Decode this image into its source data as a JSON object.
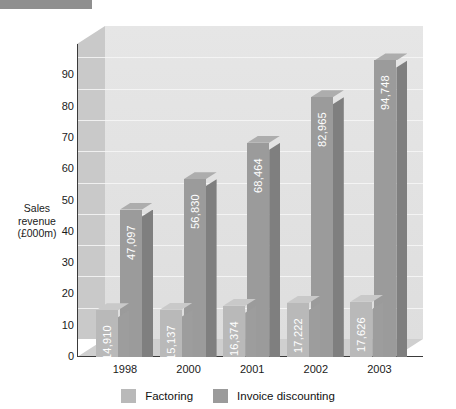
{
  "chart_data": {
    "type": "bar",
    "title": "",
    "subtitle": "",
    "xlabel": "",
    "ylabel": "Sales revenue (£000m)",
    "ylabel_lines": [
      "Sales",
      "revenue",
      "(£000m)"
    ],
    "categories": [
      "1998",
      "2000",
      "2001",
      "2002",
      "2003"
    ],
    "series": [
      {
        "name": "Factoring",
        "color": "#b9b9b9",
        "values": [
          14910,
          15137,
          16374,
          17222,
          17626
        ],
        "labels": [
          "14,910",
          "15,137",
          "16,374",
          "17,222",
          "17,626"
        ],
        "plot_values": [
          14.91,
          15.137,
          16.374,
          17.222,
          17.626
        ]
      },
      {
        "name": "Invoice discounting",
        "color": "#9b9b9b",
        "values": [
          47097,
          56830,
          68464,
          82965,
          94748
        ],
        "labels": [
          "47,097",
          "56,830",
          "68,464",
          "82,965",
          "94,748"
        ],
        "plot_values": [
          47.097,
          56.83,
          68.464,
          82.965,
          94.748
        ]
      }
    ],
    "ylim": [
      0,
      100
    ],
    "ytick_step": 10,
    "yticks": [
      0,
      10,
      20,
      30,
      40,
      50,
      60,
      70,
      80,
      90
    ],
    "ytick_labels": [
      "0",
      "10",
      "20",
      "30",
      "40",
      "50",
      "60",
      "70",
      "80",
      "90"
    ],
    "grid": true,
    "legend_position": "bottom",
    "style": "3d-clustered-column",
    "value_labels": "inside-end-rotated-vertical"
  },
  "legend": {
    "items": [
      {
        "label": "Factoring",
        "color": "#b9b9b9"
      },
      {
        "label": "Invoice discounting",
        "color": "#9b9b9b"
      }
    ]
  },
  "decor": {
    "top_bar_color": "#8f8f8f"
  }
}
